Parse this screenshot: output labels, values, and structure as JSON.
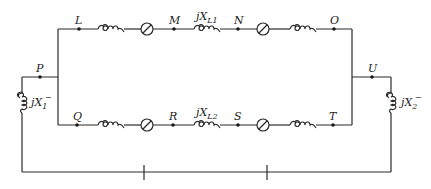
{
  "diagram": {
    "type": "circuit-schematic",
    "nodes": {
      "P": "P",
      "U": "U",
      "L": "L",
      "M": "M",
      "N": "N",
      "O": "O",
      "Q": "Q",
      "R": "R",
      "S": "S",
      "T": "T"
    },
    "reactances": {
      "left_shunt": {
        "prefix": "jX",
        "sub": "1",
        "sup": "−"
      },
      "right_shunt": {
        "prefix": "jX",
        "sub": "2",
        "sup": "−"
      },
      "top_line": {
        "prefix": "jX",
        "sub": "L1"
      },
      "bottom_line": {
        "prefix": "jX",
        "sub": "L2"
      }
    },
    "colors": {
      "line": "#2a2a2a",
      "background": "#ffffff"
    }
  }
}
